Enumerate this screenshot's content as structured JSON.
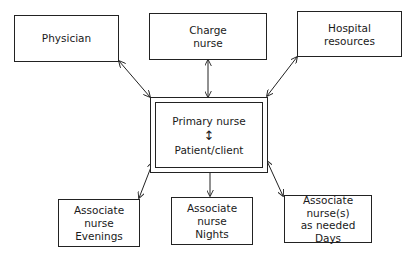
{
  "diagram": {
    "type": "hub-and-spoke organizational chart",
    "center": {
      "line1": "Primary nurse",
      "connector": "↕",
      "line2": "Patient/client"
    },
    "nodes": {
      "physician": {
        "label": "Physician"
      },
      "charge_nurse": {
        "line1": "Charge",
        "line2": "nurse"
      },
      "hospital_resources": {
        "line1": "Hospital",
        "line2": "resources"
      },
      "assoc_evenings": {
        "line1": "Associate nurse",
        "line2": "Evenings"
      },
      "assoc_nights": {
        "line1": "Associate nurse",
        "line2": "Nights"
      },
      "assoc_days": {
        "line1": "Associate nurse(s)",
        "line2": "as needed",
        "line3": "Days"
      }
    },
    "edges": [
      {
        "from": "physician",
        "to": "center",
        "style": "double-arrow"
      },
      {
        "from": "charge_nurse",
        "to": "center",
        "style": "double-arrow"
      },
      {
        "from": "hospital_resources",
        "to": "center",
        "style": "double-arrow"
      },
      {
        "from": "center",
        "to": "assoc_evenings",
        "style": "double-arrow"
      },
      {
        "from": "center",
        "to": "assoc_nights",
        "style": "double-arrow"
      },
      {
        "from": "center",
        "to": "assoc_days",
        "style": "double-arrow"
      }
    ],
    "colors": {
      "line": "#222222",
      "background": "#ffffff"
    }
  }
}
